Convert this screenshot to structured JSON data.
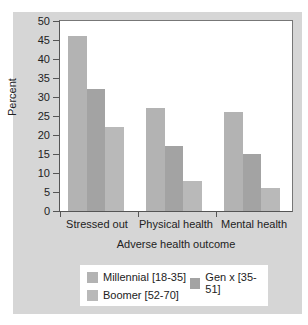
{
  "chart_data": {
    "type": "bar",
    "title": "",
    "xlabel": "Adverse health outcome",
    "ylabel": "Percent",
    "ylim": [
      0,
      50
    ],
    "yticks": [
      0,
      5,
      10,
      15,
      20,
      25,
      30,
      35,
      40,
      45,
      50
    ],
    "grid": false,
    "legend_position": "bottom",
    "categories": [
      "Stressed out",
      "Physical health",
      "Mental health"
    ],
    "series": [
      {
        "name": "Millennial [18-35]",
        "color": "#b3b3b3",
        "values": [
          46,
          27,
          26
        ]
      },
      {
        "name": "Gen x [35-51]",
        "color": "#a3a3a3",
        "values": [
          32,
          17,
          15
        ]
      },
      {
        "name": "Boomer [52-70]",
        "color": "#b9b9b9",
        "values": [
          22,
          8,
          6
        ]
      }
    ]
  },
  "labels": {
    "ytitle": "Percent",
    "xtitle": "Adverse health outcome",
    "cat0": "Stressed out",
    "cat1": "Physical health",
    "cat2": "Mental health",
    "legend0": "Millennial [18-35]",
    "legend1": "Gen x [35-51]",
    "legend2": "Boomer [52-70]",
    "y0": "0",
    "y5": "5",
    "y10": "10",
    "y15": "15",
    "y20": "20",
    "y25": "25",
    "y30": "30",
    "y35": "35",
    "y40": "40",
    "y45": "45",
    "y50": "50"
  }
}
